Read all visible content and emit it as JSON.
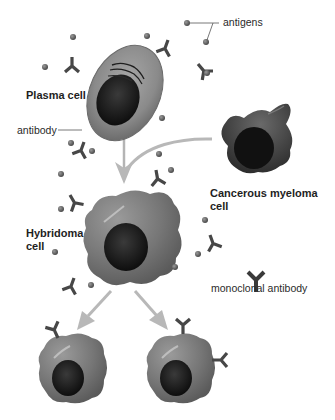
{
  "diagram": {
    "title": "",
    "labels": {
      "antigens": "antigens",
      "plasma_cell": "Plasma cell",
      "antibody": "antibody",
      "cancerous_myeloma_line1": "Cancerous myeloma",
      "cancerous_myeloma_line2": "cell",
      "hybridoma_line1": "Hybridoma",
      "hybridoma_line2": "cell",
      "monoclonal_antibody": "monoclonal antibody"
    },
    "nodes": [
      {
        "id": "plasma-cell",
        "label": "Plasma cell"
      },
      {
        "id": "myeloma-cell",
        "label": "Cancerous myeloma cell"
      },
      {
        "id": "hybridoma-cell",
        "label": "Hybridoma cell"
      },
      {
        "id": "clone-left",
        "label": ""
      },
      {
        "id": "clone-right",
        "label": ""
      }
    ],
    "edges": [
      {
        "from": "plasma-cell",
        "to": "hybridoma-cell"
      },
      {
        "from": "myeloma-cell",
        "to": "hybridoma-cell"
      },
      {
        "from": "hybridoma-cell",
        "to": "clone-left"
      },
      {
        "from": "hybridoma-cell",
        "to": "clone-right"
      }
    ],
    "colors": {
      "background": "#ffffff",
      "cell_body": "#7a7a7a",
      "plasma_body": "#8e8e8e",
      "nucleus": "#1a1a1a",
      "antibody": "#4a4a4a",
      "antigen": "#6a6a6a",
      "arrow": "#b8b8b8",
      "text": "#222222"
    }
  }
}
